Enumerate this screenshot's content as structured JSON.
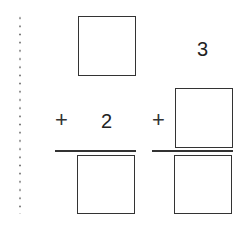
{
  "problems": [
    {
      "id": "left",
      "top_addend": "",
      "operator": "+",
      "bottom_addend": "2",
      "sum": ""
    },
    {
      "id": "right",
      "top_addend": "3",
      "operator": "+",
      "bottom_addend": "",
      "sum": ""
    }
  ],
  "colors": {
    "stroke": "#333333",
    "background": "#ffffff",
    "dots": "#777777"
  }
}
